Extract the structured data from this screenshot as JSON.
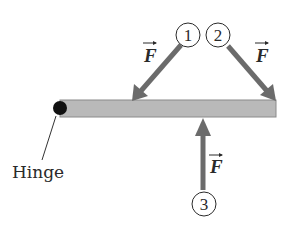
{
  "diagram": {
    "type": "free-body / torque diagram",
    "rod": {
      "fill": "#b9b9b9",
      "stroke": "#8a8a8a"
    },
    "hinge": {
      "label": "Hinge",
      "color": "#111111"
    },
    "arrow_color": "#6b6b6b",
    "forces": [
      {
        "id": "1",
        "number": "1",
        "label": "F",
        "direction": "down-left, applied at middle of rod"
      },
      {
        "id": "2",
        "number": "2",
        "label": "F",
        "direction": "down-right, applied at end of rod"
      },
      {
        "id": "3",
        "number": "3",
        "label": "F",
        "direction": "straight up, applied near end of rod"
      }
    ]
  }
}
